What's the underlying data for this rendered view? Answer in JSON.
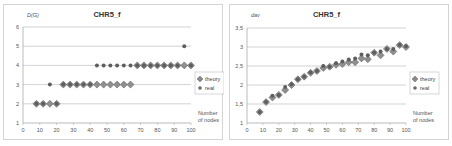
{
  "chart_data": [
    {
      "type": "scatter",
      "title": "CHR5_f",
      "ylabel": "D(G)",
      "xlabel": "Number of nodes",
      "xlim": [
        0,
        100
      ],
      "ylim": [
        1,
        6
      ],
      "xticks": [
        0,
        10,
        20,
        30,
        40,
        50,
        60,
        70,
        80,
        90,
        100
      ],
      "yticks": [
        1,
        2,
        3,
        4,
        5,
        6
      ],
      "ytick_labels": [
        "1",
        "2",
        "3",
        "4",
        "5",
        "6"
      ],
      "grid": true,
      "legend": "right",
      "series": [
        {
          "name": "theory",
          "marker": "diamond",
          "x": [
            8,
            12,
            16,
            20,
            24,
            28,
            32,
            36,
            40,
            44,
            48,
            52,
            56,
            60,
            64,
            68,
            72,
            76,
            80,
            84,
            88,
            92,
            96,
            100
          ],
          "y": [
            2,
            2,
            2,
            2,
            3,
            3,
            3,
            3,
            3,
            3,
            3,
            3,
            3,
            3,
            3,
            4,
            4,
            4,
            4,
            4,
            4,
            4,
            4,
            4
          ]
        },
        {
          "name": "real",
          "marker": "circle",
          "x": [
            8,
            12,
            16,
            20,
            24,
            28,
            32,
            36,
            40,
            44,
            48,
            52,
            56,
            60,
            64,
            68,
            72,
            76,
            80,
            84,
            88,
            92,
            96,
            100
          ],
          "y": [
            2,
            2,
            3,
            2,
            3,
            3,
            3,
            3,
            3,
            4,
            4,
            4,
            4,
            4,
            4,
            4,
            4,
            4,
            4,
            4,
            4,
            4,
            5,
            4
          ]
        }
      ]
    },
    {
      "type": "scatter",
      "title": "CHR5_f",
      "ylabel": "dav",
      "xlabel": "Number of nodes",
      "xlim": [
        0,
        100
      ],
      "ylim": [
        1,
        3.5
      ],
      "xticks": [
        0,
        10,
        20,
        30,
        40,
        50,
        60,
        70,
        80,
        90,
        100
      ],
      "yticks": [
        1,
        1.5,
        2,
        2.5,
        3,
        3.5
      ],
      "ytick_labels": [
        "1",
        "1,5",
        "2",
        "2,5",
        "3",
        "3,5"
      ],
      "grid": true,
      "legend": "right",
      "series": [
        {
          "name": "theory",
          "marker": "diamond",
          "x": [
            8,
            12,
            16,
            20,
            24,
            28,
            32,
            36,
            40,
            44,
            48,
            52,
            56,
            60,
            64,
            68,
            72,
            76,
            80,
            84,
            88,
            92,
            96,
            100
          ],
          "y": [
            1.29,
            1.55,
            1.67,
            1.74,
            1.87,
            2.0,
            2.15,
            2.22,
            2.32,
            2.37,
            2.45,
            2.48,
            2.53,
            2.55,
            2.6,
            2.6,
            2.7,
            2.68,
            2.85,
            2.78,
            2.95,
            2.88,
            3.05,
            3.0
          ]
        },
        {
          "name": "real",
          "marker": "circle",
          "x": [
            8,
            12,
            16,
            20,
            24,
            28,
            32,
            36,
            40,
            44,
            48,
            52,
            56,
            60,
            64,
            68,
            72,
            76,
            80,
            84,
            88,
            92,
            96,
            100
          ],
          "y": [
            1.29,
            1.55,
            1.72,
            1.74,
            1.95,
            2.02,
            2.15,
            2.22,
            2.33,
            2.37,
            2.5,
            2.48,
            2.57,
            2.62,
            2.67,
            2.7,
            2.8,
            2.78,
            2.85,
            2.88,
            2.95,
            2.95,
            3.05,
            3.02
          ]
        }
      ]
    }
  ]
}
